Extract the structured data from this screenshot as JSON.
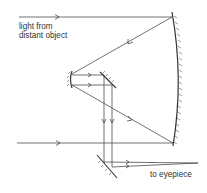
{
  "diagram": {
    "labels": {
      "source_line1": "light from",
      "source_line2": "distant object",
      "output": "to eyepiece"
    },
    "colors": {
      "line": "#333333",
      "background": "#ffffff"
    },
    "components": [
      "primary-concave-mirror",
      "secondary-convex-mirror",
      "diagonal-plane-mirror",
      "lower-plane-mirror"
    ]
  }
}
